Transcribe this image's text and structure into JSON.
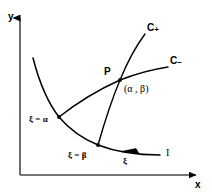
{
  "figure": {
    "kind": "characteristic-diagram",
    "background_color": "#ffffff",
    "stroke_color": "#000000",
    "axes": {
      "y_label": "y",
      "x_label": "x",
      "origin": [
        20,
        175
      ],
      "y_top": [
        20,
        15
      ],
      "x_right": [
        200,
        175
      ]
    },
    "labels": {
      "c_plus_letter": "C",
      "c_plus_sign": "+",
      "c_minus_letter": "C",
      "c_minus_sign": "−",
      "point_p": "P",
      "coords": "(α , β)",
      "xi_alpha": "ξ = α",
      "xi_beta": "ξ = β",
      "xi": "ξ",
      "initial_curve": "I"
    },
    "points": {
      "xi_alpha_node": [
        59,
        117
      ],
      "xi_beta_node": [
        98,
        145
      ],
      "intersection_p": [
        120,
        80
      ]
    },
    "curves": {
      "initial_curve_I": "descending curve from upper-left through ξ=α and ξ=β to lower-right",
      "c_plus": "rising characteristic from ξ=β through P to upper-right",
      "c_minus": "rising characteristic from ξ=α through P to right",
      "direction_arrow": "leftward arrow on I curve labelled ξ"
    }
  }
}
